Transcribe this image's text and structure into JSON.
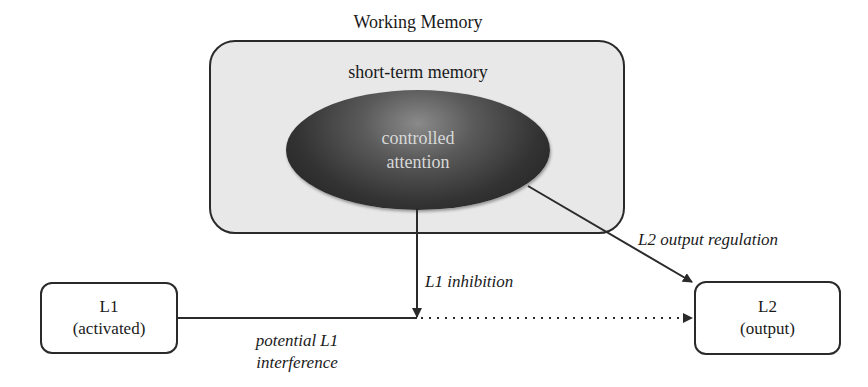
{
  "diagram": {
    "title": "Working Memory",
    "container_label": "short-term memory",
    "core": {
      "line1": "controlled",
      "line2": "attention"
    },
    "nodes": {
      "l1": {
        "title": "L1",
        "subtitle": "(activated)"
      },
      "l2": {
        "title": "L2",
        "subtitle": "(output)"
      }
    },
    "edges": {
      "inhibition": "L1 inhibition",
      "regulation": "L2 output regulation",
      "interference_line1": "potential L1",
      "interference_line2": "interference"
    },
    "colors": {
      "container_fill": "#e8e8e8",
      "ellipse_dark": "#1e1e1e",
      "ellipse_light": "#8a8a8a",
      "stroke": "#2a2a2a"
    }
  }
}
